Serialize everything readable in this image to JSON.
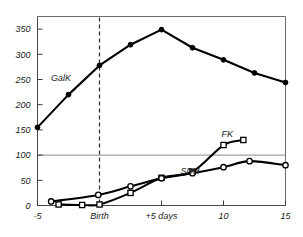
{
  "chart_data": {
    "type": "line",
    "title": "",
    "subtitle": "",
    "xlabel": "",
    "ylabel": "",
    "xlim": [
      -5,
      15
    ],
    "ylim": [
      0,
      375
    ],
    "grid": false,
    "legend_position": "inline-labels",
    "x_ticks": [
      -5,
      0,
      5,
      10,
      15
    ],
    "x_tick_labels": [
      "-5",
      "Birth",
      "+5 days",
      "10",
      "15"
    ],
    "y_ticks": [
      0,
      50,
      100,
      150,
      200,
      250,
      300,
      350
    ],
    "y_tick_labels": [
      "0",
      "50",
      "100",
      "150",
      "200",
      "250",
      "300",
      "350"
    ],
    "annotations": [
      {
        "text": "Birth",
        "type": "vertical-dashed-line",
        "x": 0
      },
      {
        "text": "100",
        "type": "horizontal-reference-line",
        "y": 100
      }
    ],
    "series": [
      {
        "name": "GalK",
        "label": "GalK",
        "label_x": -3.1,
        "label_y": 248,
        "marker": "filled-circle",
        "x": [
          -5,
          -2.5,
          0,
          2.5,
          5,
          7.5,
          10,
          12.5,
          15
        ],
        "values": [
          155,
          220,
          278,
          319,
          349,
          313,
          289,
          263,
          244
        ]
      },
      {
        "name": "FK",
        "label": "FK",
        "label_x": 10.3,
        "label_y": 136,
        "marker": "open-square",
        "x": [
          -3.3,
          -1.4,
          0,
          2.5,
          5,
          7.5,
          10,
          11.6
        ],
        "values": [
          2,
          1,
          2,
          25,
          55,
          67,
          120,
          130
        ]
      },
      {
        "name": "SDH",
        "label": "SDH",
        "label_x": 7.3,
        "label_y": 62,
        "marker": "open-circle",
        "x": [
          -3.9,
          -0.1,
          2.5,
          5,
          7.5,
          10,
          12.1,
          15
        ],
        "values": [
          8,
          21,
          38,
          54,
          64,
          76,
          88,
          80
        ]
      }
    ],
    "colors": {
      "curve": "#000000",
      "axis": "#4a4a4a",
      "frame": "#6b6b6b",
      "grid": "#8a8a8a",
      "text": "#1a1a1a",
      "background": "#ffffff"
    }
  }
}
